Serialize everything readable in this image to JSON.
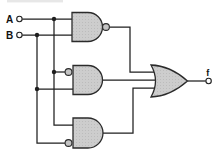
{
  "colors": {
    "background": "#ffffff",
    "wire": "#1f1f1f",
    "gate_fill": "#cdcdcd",
    "gate_stroke": "#2b2b2b",
    "bubble_fill": "#c4c4c4",
    "terminal_fill": "#ffffff"
  },
  "diagram": {
    "type": "logic-circuit",
    "inputs": [
      {
        "label": "A"
      },
      {
        "label": "B"
      }
    ],
    "output": {
      "label": "f"
    },
    "gates": [
      {
        "name": "nand-top",
        "type": "NAND",
        "inputs": [
          "A",
          "B"
        ],
        "bubbles": {
          "output": true
        }
      },
      {
        "name": "and-middle",
        "type": "AND",
        "inputs": [
          "A",
          "B"
        ],
        "bubbles": {
          "input_top": true
        }
      },
      {
        "name": "and-bottom",
        "type": "AND",
        "inputs": [
          "A",
          "B"
        ],
        "bubbles": {
          "input_bottom": true
        }
      },
      {
        "name": "or-output",
        "type": "OR",
        "inputs": [
          "nand-top",
          "and-middle",
          "and-bottom"
        ],
        "output": "f"
      }
    ]
  }
}
